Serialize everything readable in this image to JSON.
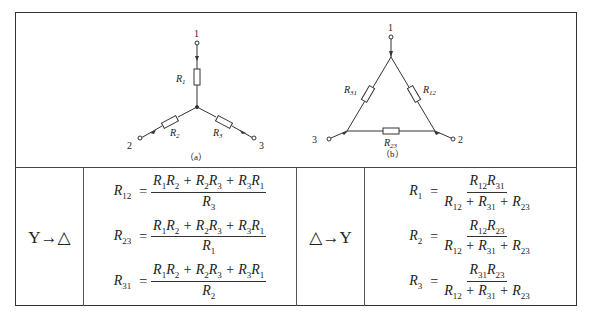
{
  "figure": {
    "star_caption": "（a）",
    "delta_caption": "（b）",
    "star_nodes": [
      "1",
      "2",
      "3"
    ],
    "delta_nodes": [
      "1",
      "2",
      "3"
    ],
    "star_resistors": [
      "R1",
      "R2",
      "R3"
    ],
    "delta_resistors": [
      "R12",
      "R23",
      "R31"
    ]
  },
  "table": {
    "rows": [
      {
        "label": "Y→△",
        "formulas": [
          {
            "lhs": "R12",
            "num": "R1R2 + R2R3 + R3R1",
            "den": "R3"
          },
          {
            "lhs": "R23",
            "num": "R1R2 + R2R3 + R3R1",
            "den": "R1"
          },
          {
            "lhs": "R31",
            "num": "R1R2 + R2R3 + R3R1",
            "den": "R2"
          }
        ]
      },
      {
        "label": "△→Y",
        "formulas": [
          {
            "lhs": "R1",
            "num": "R12R31",
            "den": "R12 + R31 + R23"
          },
          {
            "lhs": "R2",
            "num": "R12R23",
            "den": "R12 + R31 + R23"
          },
          {
            "lhs": "R3",
            "num": "R31R23",
            "den": "R12 + R31 + R23"
          }
        ]
      }
    ]
  }
}
